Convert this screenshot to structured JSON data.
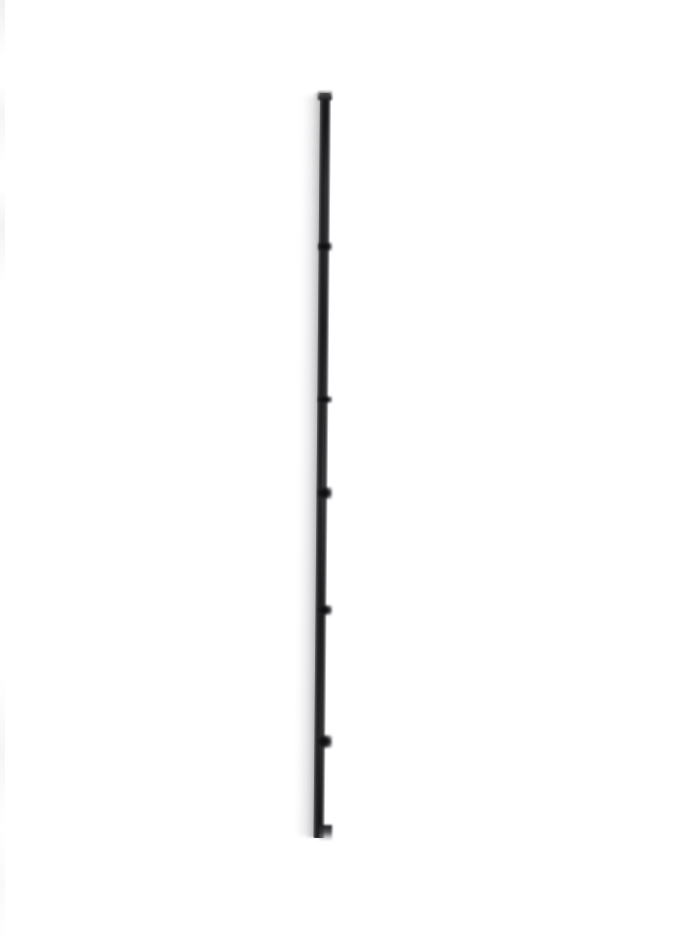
{
  "image": {
    "kind": "natural-image",
    "subject": "dried plant stem specimen",
    "orientation": "vertical",
    "width_px": 679,
    "height_px": 940,
    "background_color": "#ffffff",
    "caption": "",
    "visible_text": ""
  },
  "palette": {
    "background": "#ffffff",
    "stem_darkest": "#141416",
    "stem_mid": "#28282b",
    "stem_rind": "#cecdd1",
    "halo_shadow": "#e4e4e6",
    "edge_artifact": "#e9e9eb"
  },
  "specimen": {
    "name": "plant-stem",
    "top_y": 93,
    "bottom_y": 836,
    "center_x": 325,
    "stem_width_px": 11,
    "lean_degrees": 0.5,
    "top_end": "blunt cut",
    "bottom_end": "tapered frayed base",
    "nodes": [
      {
        "label": "node-1",
        "y": 242,
        "height": 9
      },
      {
        "label": "node-2",
        "y": 396,
        "height": 7
      },
      {
        "label": "node-3",
        "y": 487,
        "height": 12
      },
      {
        "label": "node-4",
        "y": 605,
        "height": 10
      },
      {
        "label": "node-5",
        "y": 735,
        "height": 13
      }
    ]
  }
}
